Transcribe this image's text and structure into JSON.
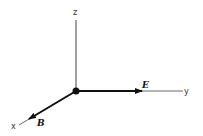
{
  "diagram": {
    "type": "3d-coordinate-axes",
    "axes": {
      "x": {
        "label": "x"
      },
      "y": {
        "label": "y"
      },
      "z": {
        "label": "z"
      }
    },
    "vectors": {
      "E": {
        "label": "E",
        "direction": "+y"
      },
      "B": {
        "label": "B",
        "direction": "+x"
      }
    },
    "colors": {
      "axis": "#444444",
      "vector": "#111111",
      "origin": "#111111"
    }
  }
}
